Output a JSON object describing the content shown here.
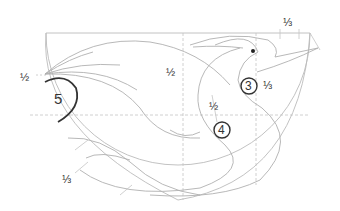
{
  "diagram": {
    "colors": {
      "guide_line": "#bbbbbb",
      "construction_line": "#b0b0b0",
      "bold_outline": "#333333",
      "text": "#333333"
    },
    "labels": {
      "left_half": "½",
      "center_half": "½",
      "neck_half": "½",
      "top_third": "⅓",
      "eye_third": "⅓",
      "bottom_third": "⅓"
    },
    "markers": {
      "marker_3": "3",
      "marker_4": "4",
      "marker_5": "5"
    }
  }
}
